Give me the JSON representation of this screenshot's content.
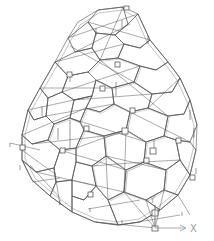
{
  "view": {
    "type": "3d-wireframe-structural-model",
    "background": "#ffffff",
    "line_color": "#5c5c5c"
  },
  "axis_gizmo": {
    "x_label": "X",
    "y_label": "Y",
    "color": "#9a9a9a"
  }
}
